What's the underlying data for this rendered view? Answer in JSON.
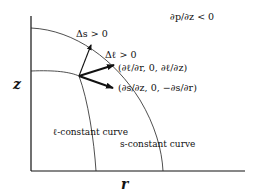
{
  "diagram": {
    "axes": {
      "x_label": "r",
      "y_label": "z"
    },
    "condition": "∂p/∂z < 0",
    "arrows": {
      "delta_s": "Δs > 0",
      "delta_l": "Δℓ > 0",
      "grad_l": "(∂ℓ/∂r, 0, ∂ℓ/∂z)",
      "perp_s": "(∂s/∂z, 0, −∂s/∂r)"
    },
    "curves": {
      "l_curve": "ℓ-constant curve",
      "s_curve": "s-constant curve"
    },
    "colors": {
      "ink": "#111111",
      "background": "#ffffff"
    }
  }
}
